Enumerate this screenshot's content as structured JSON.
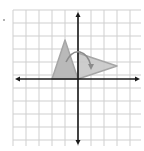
{
  "diagram": {
    "type": "coordinate-plane-rotation",
    "grid": {
      "x_min": -5,
      "x_max": 5,
      "y_min": -5,
      "y_max": 5,
      "cell_px": 13,
      "origin_px": [
        78,
        79
      ],
      "left_px": 13,
      "right_px": 141,
      "top_px": 10,
      "bottom_px": 146,
      "grid_color": "#cfcfcf",
      "axis_color": "#1a1a1a"
    },
    "original_triangle": {
      "vertices": [
        [
          -2,
          0
        ],
        [
          -1,
          3
        ],
        [
          0,
          0
        ]
      ],
      "fill": "#b9b9b9",
      "stroke": "#a6a6a6"
    },
    "rotated_triangle": {
      "vertices": [
        [
          0,
          0
        ],
        [
          0,
          2
        ],
        [
          3,
          1
        ]
      ],
      "fill": "#c8c8c8",
      "stroke": "#a6a6a6"
    },
    "rotation_arrow": {
      "direction": "clockwise",
      "color": "#8a8a8a"
    }
  },
  "marker": {
    "label": ""
  }
}
